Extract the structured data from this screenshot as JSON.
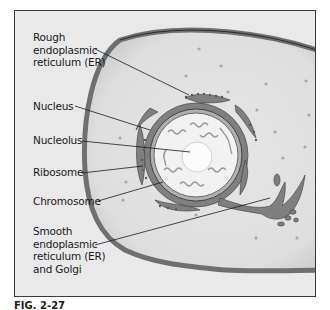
{
  "labels": {
    "rough_er": "Rough\nendoplasmic\nreticulum (ER)",
    "nucleus": "Nucleus",
    "nucleolus": "Nucleolus",
    "ribosome": "Ribosome",
    "chromosome": "Chromosome",
    "smooth_er": "Smooth\nendoplasmic\nreticulum (ER)\nand Golgi"
  },
  "caption": "FIG. 2-27",
  "colors": {
    "background": "#e9e9e9",
    "cytoplasm": "#dcdcdc",
    "membrane": "#7d7d7d",
    "er": "#808080",
    "nucleoplasm": "#f2f2f2",
    "outline": "#2a2a2a"
  }
}
